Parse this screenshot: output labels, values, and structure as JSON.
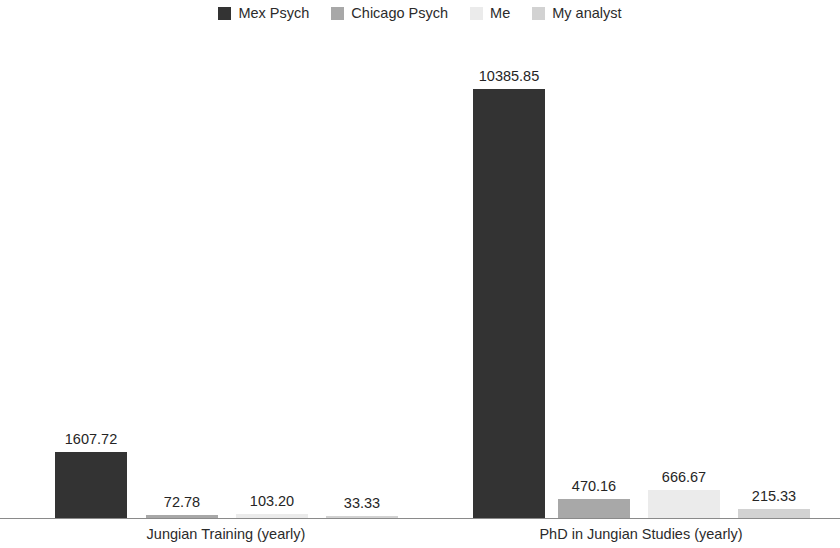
{
  "chart_data": {
    "type": "bar",
    "title": "",
    "subtitle": "",
    "xlabel": "",
    "ylabel": "",
    "grid": false,
    "legend_position": "top-center",
    "axis_visible": {
      "x_axis_line": true,
      "y_axis_line": false,
      "y_tick_labels": false
    },
    "categories": [
      "Jungian Training (yearly)",
      "PhD in Jungian Studies (yearly)"
    ],
    "ylim": [
      0,
      10385.85
    ],
    "data_labels": true,
    "series": [
      {
        "name": "Mex Psych",
        "color": "#333333",
        "values": [
          1607.72,
          10385.85
        ],
        "value_labels": [
          "1607.72",
          "10385.85"
        ]
      },
      {
        "name": "Chicago Psych",
        "color": "#a8a8a8",
        "values": [
          72.78,
          470.16
        ],
        "value_labels": [
          "72.78",
          "470.16"
        ]
      },
      {
        "name": "Me",
        "color": "#ebebeb",
        "values": [
          103.2,
          666.67
        ],
        "value_labels": [
          "103.20",
          "666.67"
        ]
      },
      {
        "name": "My analyst",
        "color": "#d2d2d2",
        "values": [
          33.33,
          215.33
        ],
        "value_labels": [
          "215.33",
          "215.33"
        ]
      }
    ]
  },
  "legend": {
    "entries": [
      {
        "label": "Mex Psych",
        "color": "#333333",
        "swatch_icon": "square-swatch-icon"
      },
      {
        "label": "Chicago Psych",
        "color": "#a8a8a8",
        "swatch_icon": "square-swatch-icon"
      },
      {
        "label": "Me",
        "color": "#ebebeb",
        "swatch_icon": "square-swatch-icon"
      },
      {
        "label": "My analyst",
        "color": "#d2d2d2",
        "swatch_icon": "square-swatch-icon"
      }
    ]
  },
  "bars": [
    {
      "series": "Mex Psych",
      "category": "Jungian Training (yearly)",
      "value": 1607.72,
      "label": "1607.72",
      "color": "#333333",
      "x": 55,
      "width": 72
    },
    {
      "series": "Chicago Psych",
      "category": "Jungian Training (yearly)",
      "value": 72.78,
      "label": "72.78",
      "color": "#a8a8a8",
      "x": 146,
      "width": 72
    },
    {
      "series": "Me",
      "category": "Jungian Training (yearly)",
      "value": 103.2,
      "label": "103.20",
      "color": "#ebebeb",
      "x": 236,
      "width": 72
    },
    {
      "series": "My analyst",
      "category": "Jungian Training (yearly)",
      "value": 33.33,
      "label": "33.33",
      "color": "#d2d2d2",
      "x": 326,
      "width": 72
    },
    {
      "series": "Mex Psych",
      "category": "PhD in Jungian Studies (yearly)",
      "value": 10385.85,
      "label": "10385.85",
      "color": "#333333",
      "x": 473,
      "width": 72
    },
    {
      "series": "Chicago Psych",
      "category": "PhD in Jungian Studies (yearly)",
      "value": 470.16,
      "label": "470.16",
      "color": "#a8a8a8",
      "x": 558,
      "width": 72
    },
    {
      "series": "Me",
      "category": "PhD in Jungian Studies (yearly)",
      "value": 666.67,
      "label": "666.67",
      "color": "#ebebeb",
      "x": 648,
      "width": 72
    },
    {
      "series": "My analyst",
      "category": "PhD in Jungian Studies (yearly)",
      "value": 215.33,
      "label": "215.33",
      "color": "#d2d2d2",
      "x": 738,
      "width": 72
    }
  ],
  "category_labels": [
    {
      "text": "Jungian Training (yearly)",
      "center_x": 226
    },
    {
      "text": "PhD in Jungian Studies (yearly)",
      "center_x": 641
    }
  ],
  "colors": {
    "background": "#ffffff",
    "axis": "#8a8a8a",
    "text": "#252525",
    "series_1": "#333333",
    "series_2": "#a8a8a8",
    "series_3": "#ebebeb",
    "series_4": "#d2d2d2"
  }
}
